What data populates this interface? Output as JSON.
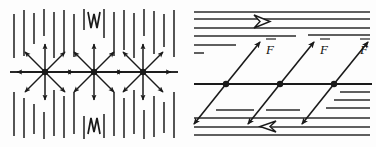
{
  "figure": {
    "background_color": "#fdfdfd",
    "ink_color": "#1a1a1a",
    "width": 376,
    "height": 147
  },
  "panels": [
    {
      "id": "left",
      "name": "radial-force-panel",
      "description": "Vertically hatched medium with a horizontal interface line and three radial eight-ray force stars",
      "hatch": {
        "orientation": "vertical",
        "count_top": 17,
        "count_bottom": 17,
        "color": "#2a2a2a"
      },
      "interface_line": {
        "y": 72,
        "x1": 10,
        "x2": 178,
        "color": "#2a2a2a"
      },
      "nodes": [
        {
          "label": "node-1",
          "x": 45,
          "y": 72,
          "rays": 8
        },
        {
          "label": "node-2",
          "x": 94,
          "y": 72,
          "rays": 8
        },
        {
          "label": "node-3",
          "x": 143,
          "y": 72,
          "rays": 8
        }
      ],
      "marks": [
        {
          "name": "top-chevron-mark",
          "glyph": "W",
          "x": 94,
          "y": 24
        },
        {
          "name": "bottom-chevron-mark",
          "glyph": "M",
          "x": 94,
          "y": 126
        }
      ]
    },
    {
      "id": "right",
      "name": "shear-force-panel",
      "description": "Horizontally hatched medium with a horizontal shear line and three double-headed oblique force vectors labelled F",
      "hatch": {
        "orientation": "horizontal",
        "color": "#2a2a2a"
      },
      "shear_line": {
        "y": 84,
        "x1": 6,
        "x2": 184,
        "color": "#1a1a1a"
      },
      "boundary_arrows": [
        {
          "name": "top-boundary-arrow",
          "direction": "right",
          "style": "hollow",
          "x": 74,
          "y": 22
        },
        {
          "name": "bottom-boundary-arrow",
          "direction": "left",
          "style": "hollow",
          "x": 74,
          "y": 126
        }
      ],
      "vectors": [
        {
          "name": "force-vector-1",
          "label": "F",
          "overbar": true,
          "x": 38,
          "y": 84,
          "angle_deg": 55
        },
        {
          "name": "force-vector-2",
          "label": "F",
          "overbar": true,
          "x": 92,
          "y": 84,
          "angle_deg": 55
        },
        {
          "name": "force-vector-3",
          "label": "F",
          "overbar": true,
          "x": 146,
          "y": 84,
          "angle_deg": 55
        }
      ],
      "labels": [
        {
          "name": "force-label-1",
          "text": "F"
        },
        {
          "name": "force-label-2",
          "text": "F"
        },
        {
          "name": "force-label-3",
          "text": "F"
        }
      ]
    }
  ]
}
